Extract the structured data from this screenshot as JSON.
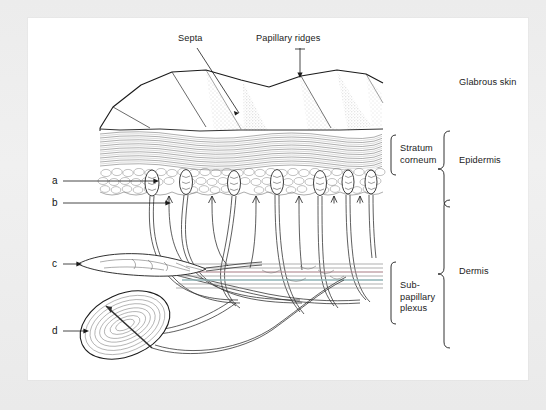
{
  "figure": {
    "caption": "",
    "background_color": "#eaeaea",
    "plate_color": "#ffffff",
    "ink_color": "#1b1b1b"
  },
  "labels": {
    "septa": "Septa",
    "papillary_ridges": "Papillary ridges",
    "glabrous_skin": "Glabrous skin",
    "stratum_corneum": "Stratum\ncorneum",
    "epidermis": "Epidermis",
    "sub_papillary_plexus": "Sub-\npapillary\nplexus",
    "dermis": "Dermis"
  },
  "keys": {
    "a": "a",
    "b": "b",
    "c": "c",
    "d": "d"
  },
  "structures": {
    "surface": "papillary-ridge-surface",
    "stratum_corneum_layer": "stratum-corneum-layer",
    "basal_cell_layer": "basal-cell-layer",
    "meissner_corpuscles": "meissner-corpuscle",
    "merkel_endings": "merkel-nerve-ending",
    "ruffini_ending": "ruffini-ending",
    "pacinian_corpuscle": "pacinian-corpuscle",
    "nerve_fibres": "nerve-fibre-bundle",
    "plexus_band": "sub-papillary-plexus-band"
  },
  "plexus_colors": {
    "artery": "#b08a92",
    "vein": "#8fb3b6",
    "neutral": "#8e8e8e"
  }
}
